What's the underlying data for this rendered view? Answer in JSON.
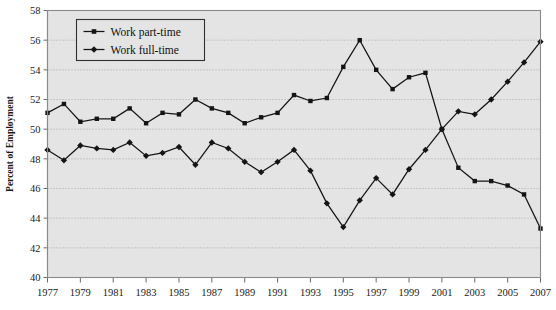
{
  "chart_data": {
    "type": "line",
    "title": "",
    "xlabel": "",
    "ylabel": "Percent of Employment",
    "ylim": [
      40,
      58
    ],
    "ytick_step": 2,
    "yticks": [
      40,
      42,
      44,
      46,
      48,
      50,
      52,
      54,
      56,
      58
    ],
    "xlim": [
      1977,
      2007
    ],
    "xtick_step": 2,
    "xticks": [
      1977,
      1979,
      1981,
      1983,
      1985,
      1987,
      1989,
      1991,
      1993,
      1995,
      1997,
      1999,
      2001,
      2003,
      2005,
      2007
    ],
    "x": [
      1977,
      1978,
      1979,
      1980,
      1981,
      1982,
      1983,
      1984,
      1985,
      1986,
      1987,
      1988,
      1989,
      1990,
      1991,
      1992,
      1993,
      1994,
      1995,
      1996,
      1997,
      1998,
      1999,
      2000,
      2001,
      2002,
      2003,
      2004,
      2005,
      2006,
      2007
    ],
    "grid": true,
    "grid_axis": "y",
    "legend_position": "top-left",
    "plot_background": "#e4e4e4",
    "series_color": "#141414",
    "series": [
      {
        "name": "Work part-time",
        "marker": "square",
        "values": [
          51.1,
          51.7,
          50.5,
          50.7,
          50.7,
          51.4,
          50.4,
          51.1,
          51.0,
          52.0,
          51.4,
          51.1,
          50.4,
          50.8,
          51.1,
          52.3,
          51.9,
          52.1,
          54.2,
          56.0,
          54.0,
          52.7,
          53.5,
          53.8,
          50.0,
          47.4,
          46.5,
          46.5,
          46.2,
          45.6,
          43.3
        ]
      },
      {
        "name": "Work full-time",
        "marker": "diamond",
        "values": [
          48.6,
          47.9,
          48.9,
          48.7,
          48.6,
          49.1,
          48.2,
          48.4,
          48.8,
          47.6,
          49.1,
          48.7,
          47.8,
          47.1,
          47.8,
          48.6,
          47.2,
          45.0,
          43.4,
          45.2,
          46.7,
          45.6,
          47.3,
          48.6,
          50.0,
          51.2,
          51.0,
          52.0,
          53.2,
          54.5,
          55.9
        ]
      }
    ]
  },
  "legend": {
    "items": [
      {
        "label": "Work part-time",
        "marker": "square"
      },
      {
        "label": "Work full-time",
        "marker": "diamond"
      }
    ]
  }
}
